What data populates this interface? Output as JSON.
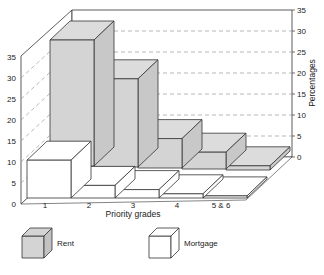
{
  "chart_data": {
    "type": "bar",
    "subtype": "3d-grouped-depth",
    "title": "",
    "xlabel": "Priority grades",
    "ylabel": "Percentages",
    "categories": [
      "1",
      "2",
      "3",
      "4",
      "5 & 6"
    ],
    "series": [
      {
        "name": "Rent",
        "row": "back",
        "color": "#d4d4d4",
        "values": [
          30,
          21,
          7,
          4,
          1
        ]
      },
      {
        "name": "Mortgage",
        "row": "front",
        "color": "#ffffff",
        "values": [
          9,
          3,
          2,
          1,
          0.5
        ]
      }
    ],
    "ylim": [
      0,
      35
    ],
    "yticks": [
      0,
      5,
      10,
      15,
      20,
      25,
      30,
      35
    ],
    "grid": "dashed horizontal on back and side walls",
    "axes": {
      "left_ticks": true,
      "right_ticks": true
    },
    "legend": {
      "position": "bottom",
      "entries": [
        "Rent",
        "Mortgage"
      ]
    }
  },
  "axis": {
    "left_ticks": [
      "0",
      "5",
      "10",
      "15",
      "20",
      "25",
      "30",
      "35"
    ],
    "right_ticks": [
      "0",
      "5",
      "10",
      "15",
      "20",
      "25",
      "30",
      "35"
    ],
    "x_title": "Priority grades",
    "y_title": "Percentages"
  },
  "legend": {
    "rent_label": "Rent",
    "mortgage_label": "Mortgage"
  }
}
